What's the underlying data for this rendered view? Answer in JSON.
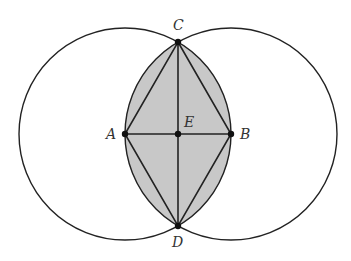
{
  "diagram": {
    "points": {
      "A": {
        "label": "A",
        "x": 125,
        "y": 134
      },
      "B": {
        "label": "B",
        "x": 231,
        "y": 134
      },
      "C": {
        "label": "C",
        "x": 178,
        "y": 42
      },
      "D": {
        "label": "D",
        "x": 178,
        "y": 226
      },
      "E": {
        "label": "E",
        "x": 178,
        "y": 134
      }
    },
    "radius": 106,
    "colors": {
      "stroke": "#222222",
      "fill": "#c8c8c8",
      "label": "#333333"
    }
  }
}
